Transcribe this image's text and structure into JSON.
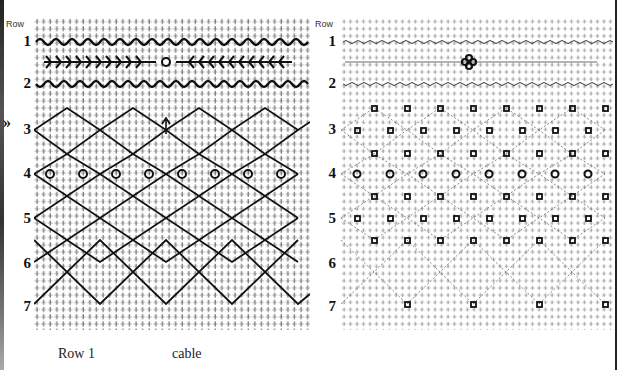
{
  "left_chart": {
    "header": "Row",
    "rows": [
      "1",
      "2",
      "3",
      "4",
      "5",
      "6",
      "7"
    ],
    "marker": "»",
    "style": "bold cable/diamond lattice"
  },
  "right_chart": {
    "header": "Row",
    "rows": [
      "1",
      "2",
      "3",
      "4",
      "5",
      "6",
      "7"
    ],
    "style": "light dotted lattice with knot motifs"
  },
  "captions": {
    "row_label": "Row 1",
    "type_label": "cable"
  },
  "colors": {
    "ink": "#111111",
    "paper": "#ffffff",
    "grid": "#555555"
  }
}
